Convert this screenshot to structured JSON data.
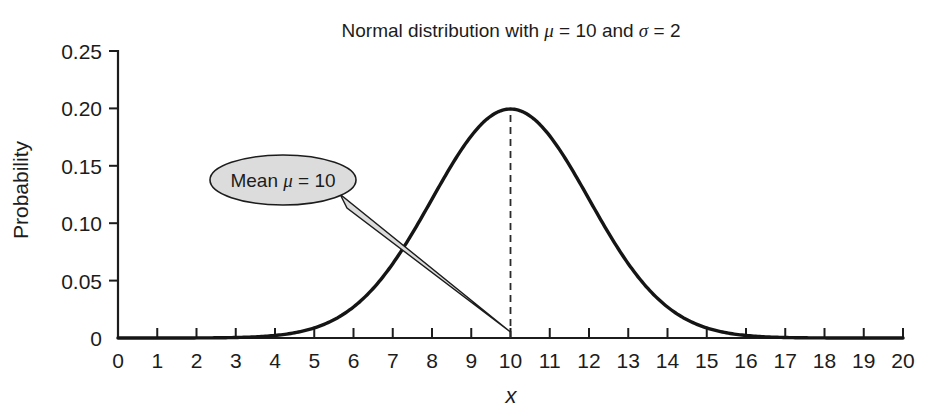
{
  "chart_data": {
    "type": "line",
    "title": "Normal distribution with μ = 10 and σ = 2",
    "title_parts": {
      "prefix": "Normal distribution with ",
      "mu_symbol": "μ",
      "mu_eq": " = 10 and ",
      "sigma_symbol": "σ",
      "sigma_eq": " = 2"
    },
    "xlabel": "x",
    "ylabel": "Probability",
    "xlim": [
      0,
      20
    ],
    "ylim": [
      0,
      0.25
    ],
    "grid": false,
    "legend": null,
    "xticks": [
      0,
      1,
      2,
      3,
      4,
      5,
      6,
      7,
      8,
      9,
      10,
      11,
      12,
      13,
      14,
      15,
      16,
      17,
      18,
      19,
      20
    ],
    "xtick_labels": [
      "0",
      "1",
      "2",
      "3",
      "4",
      "5",
      "6",
      "7",
      "8",
      "9",
      "10",
      "11",
      "12",
      "13",
      "14",
      "15",
      "16",
      "17",
      "18",
      "19",
      "20"
    ],
    "yticks": [
      0,
      0.05,
      0.1,
      0.15,
      0.2,
      0.25
    ],
    "ytick_labels": [
      "0",
      "0.05",
      "0.10",
      "0.15",
      "0.20",
      "0.25"
    ],
    "distribution": {
      "kind": "normal",
      "mu": 10,
      "sigma": 2,
      "peak_value": 0.1995
    },
    "series": [
      {
        "name": "Normal pdf",
        "color": "#151515",
        "x": [
          0,
          0.5,
          1,
          1.5,
          2,
          2.5,
          3,
          3.5,
          4,
          4.5,
          5,
          5.5,
          6,
          6.5,
          7,
          7.5,
          8,
          8.5,
          9,
          9.5,
          10,
          10.5,
          11,
          11.5,
          12,
          12.5,
          13,
          13.5,
          14,
          14.5,
          15,
          15.5,
          16,
          16.5,
          17,
          17.5,
          18,
          18.5,
          19,
          19.5,
          20
        ],
        "values": [
          0.0,
          0.0,
          0.0,
          0.0,
          0.0001,
          0.0002,
          0.0004,
          0.0009,
          0.0022,
          0.0046,
          0.0088,
          0.0158,
          0.0266,
          0.0417,
          0.0648,
          0.091,
          0.121,
          0.1505,
          0.176,
          0.1933,
          0.1995,
          0.1933,
          0.176,
          0.1505,
          0.121,
          0.091,
          0.0648,
          0.0417,
          0.0266,
          0.0158,
          0.0088,
          0.0046,
          0.0022,
          0.0009,
          0.0004,
          0.0002,
          0.0001,
          0.0,
          0.0,
          0.0,
          0.0
        ]
      }
    ],
    "annotations": [
      {
        "name": "mean-callout",
        "text": "Mean μ = 10",
        "text_parts": {
          "prefix": "Mean ",
          "symbol": "μ",
          "suffix": " = 10"
        },
        "points_to_x": 10,
        "points_to_y": 0,
        "fill_color": "#dcdcdc",
        "stroke_color": "#1c1c1c"
      },
      {
        "name": "mean-dashed-line",
        "kind": "vertical-dashed-line",
        "x": 10,
        "y_from": 0,
        "y_to": 0.1995
      }
    ]
  }
}
